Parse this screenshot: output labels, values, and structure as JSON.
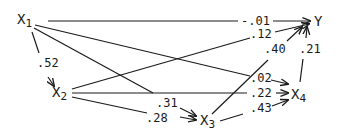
{
  "diagram": {
    "type": "path-diagram",
    "stroke_color": "#1a1a1a",
    "nodes": [
      {
        "id": "X1",
        "label": "X",
        "sub": "1"
      },
      {
        "id": "X2",
        "label": "X",
        "sub": "2"
      },
      {
        "id": "X3",
        "label": "X",
        "sub": "3"
      },
      {
        "id": "X4",
        "label": "X",
        "sub": "4"
      },
      {
        "id": "Y",
        "label": "Y",
        "sub": ""
      }
    ],
    "edges": [
      {
        "from": "X1",
        "to": "Y",
        "coef": "-.01"
      },
      {
        "from": "X1",
        "to": "X2",
        "coef": ".52"
      },
      {
        "from": "X1",
        "to": "X4",
        "coef": ".02"
      },
      {
        "from": "X1",
        "to": "X3",
        "coef": ".31"
      },
      {
        "from": "X2",
        "to": "Y",
        "coef": ".12"
      },
      {
        "from": "X2",
        "to": "X4",
        "coef": ".22"
      },
      {
        "from": "X2",
        "to": "X3",
        "coef": ".28"
      },
      {
        "from": "X3",
        "to": "Y",
        "coef": ".40"
      },
      {
        "from": "X3",
        "to": "X4",
        "coef": ".43"
      },
      {
        "from": "X4",
        "to": "Y",
        "coef": ".21"
      }
    ]
  }
}
